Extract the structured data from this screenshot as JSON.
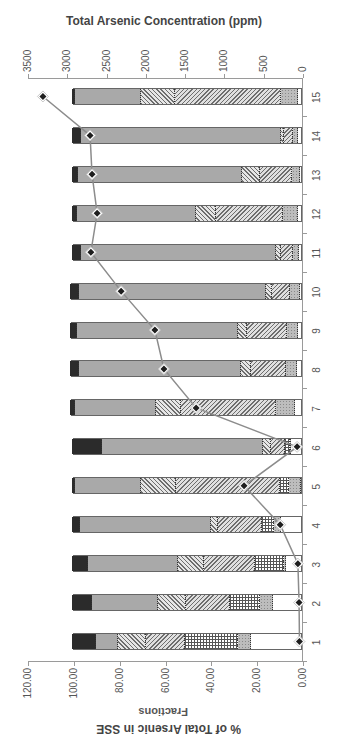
{
  "chart_data": {
    "type": "bar",
    "subtype": "stacked-bar-with-line-overlay",
    "orientation_note": "figure rotated 90 degrees counterclockwise in the image",
    "title": "",
    "xlabel": "Fractions",
    "ylabel": "% of Total Arsenic in SSE",
    "y2label": "Total Arsenic Concentration (ppm)",
    "categories": [
      "1",
      "2",
      "3",
      "4",
      "5",
      "6",
      "7",
      "8",
      "9",
      "10",
      "11",
      "12",
      "13",
      "14",
      "15"
    ],
    "ylim": [
      0,
      120
    ],
    "yticks": [
      "0.00",
      "20.00",
      "40.00",
      "60.00",
      "80.00",
      "100.00",
      "120.00"
    ],
    "y2lim": [
      0,
      3500
    ],
    "y2ticks": [
      "0",
      "500",
      "1000",
      "1500",
      "2000",
      "2500",
      "3000",
      "3500"
    ],
    "legend": null,
    "grid": false,
    "series": [
      {
        "name": "Fraction A (white)",
        "style": "white",
        "values": [
          21.7,
          12.3,
          6.5,
          8.7,
          0.0,
          4.4,
          2.6,
          1.7,
          1.3,
          0.5,
          1.0,
          1.3,
          0.5,
          1.3,
          1.3
        ]
      },
      {
        "name": "Fraction B (dotted grey)",
        "style": "dotted",
        "values": [
          5.8,
          5.8,
          1.0,
          3.1,
          5.2,
          0.5,
          8.3,
          4.8,
          4.8,
          4.4,
          2.6,
          6.5,
          3.5,
          2.2,
          7.5
        ]
      },
      {
        "name": "Fraction C (checkered)",
        "style": "grid",
        "values": [
          23.2,
          13.1,
          12.4,
          5.2,
          3.9,
          2.2,
          0.0,
          0.0,
          0.0,
          0.0,
          0.0,
          0.0,
          0.0,
          0.0,
          0.0
        ]
      },
      {
        "name": "Fraction D (back-diagonal hatch)",
        "style": "back",
        "values": [
          17.1,
          18.8,
          22.4,
          19.2,
          45.4,
          6.1,
          41.5,
          15.3,
          17.5,
          7.9,
          5.2,
          29.3,
          14.0,
          3.9,
          46.0
        ]
      },
      {
        "name": "Fraction E (forward-diagonal hatch)",
        "style": "fwd",
        "values": [
          11.9,
          12.6,
          11.3,
          3.1,
          15.3,
          3.5,
          10.9,
          4.4,
          3.9,
          2.6,
          2.2,
          8.7,
          7.9,
          1.3,
          15.0
        ]
      },
      {
        "name": "Fraction F (grey)",
        "style": "grey",
        "values": [
          9.9,
          28.7,
          39.4,
          57.2,
          28.8,
          70.3,
          35.4,
          70.7,
          70.3,
          81.7,
          85.1,
          52.0,
          71.5,
          87.3,
          28.7
        ]
      },
      {
        "name": "Fraction G (black)",
        "style": "black",
        "values": [
          10.4,
          8.7,
          7.0,
          3.5,
          1.4,
          13.0,
          2.2,
          3.9,
          3.0,
          3.9,
          3.9,
          2.2,
          2.6,
          3.9,
          1.5
        ]
      }
    ],
    "line_series": {
      "name": "Total Arsenic Concentration (ppm)",
      "axis": "y2",
      "marker": "diamond",
      "values": [
        45,
        50,
        65,
        290,
        750,
        75,
        1360,
        1770,
        1885,
        2315,
        2700,
        2620,
        2685,
        2710,
        3310
      ]
    },
    "colors": {
      "black": "#2b2b2b",
      "grey": "#a9a9a9",
      "line": "#8c8c8c",
      "marker": "#1e1e1e",
      "axis": "#9a9a9a"
    }
  }
}
